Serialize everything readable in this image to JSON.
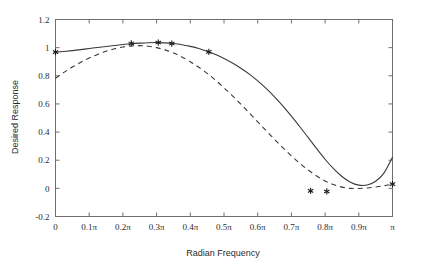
{
  "chart_data": {
    "type": "line",
    "title": "",
    "xlabel": "Radian Frequency",
    "ylabel": "Desired Response",
    "xlim": [
      0,
      1
    ],
    "ylim": [
      -0.2,
      1.2
    ],
    "grid": false,
    "legend_position": "none",
    "x_tick_labels": [
      "0",
      "0.1π",
      "0.2π",
      "0.3π",
      "0.4π",
      "0.5π",
      "0.6π",
      "0.7π",
      "0.8π",
      "0.9π",
      "π"
    ],
    "x_tick_values": [
      0,
      0.1,
      0.2,
      0.3,
      0.4,
      0.5,
      0.6,
      0.7,
      0.8,
      0.9,
      1.0
    ],
    "y_tick_labels": [
      "-0.2",
      "0",
      "0.2",
      "0.4",
      "0.6",
      "0.8",
      "1",
      "1.2"
    ],
    "y_tick_values": [
      -0.2,
      0,
      0.2,
      0.4,
      0.6,
      0.8,
      1.0,
      1.2
    ],
    "series": [
      {
        "name": "solid-response",
        "style": "solid",
        "color": "#3a3a3a",
        "x": [
          0.0,
          0.025,
          0.05,
          0.075,
          0.1,
          0.125,
          0.15,
          0.175,
          0.2,
          0.225,
          0.25,
          0.275,
          0.3,
          0.325,
          0.35,
          0.375,
          0.4,
          0.425,
          0.45,
          0.475,
          0.5,
          0.525,
          0.55,
          0.575,
          0.6,
          0.625,
          0.65,
          0.675,
          0.7,
          0.725,
          0.75,
          0.775,
          0.8,
          0.825,
          0.85,
          0.875,
          0.9,
          0.925,
          0.95,
          0.975,
          1.0
        ],
        "y": [
          0.968,
          0.973,
          0.979,
          0.986,
          0.994,
          1.001,
          1.008,
          1.015,
          1.022,
          1.028,
          1.032,
          1.035,
          1.036,
          1.034,
          1.029,
          1.021,
          1.009,
          0.994,
          0.974,
          0.951,
          0.923,
          0.891,
          0.854,
          0.812,
          0.764,
          0.71,
          0.65,
          0.584,
          0.513,
          0.438,
          0.36,
          0.282,
          0.207,
          0.14,
          0.084,
          0.044,
          0.023,
          0.024,
          0.05,
          0.11,
          0.222
        ]
      },
      {
        "name": "dashed-response",
        "style": "dashed",
        "color": "#3a3a3a",
        "x": [
          0.0,
          0.025,
          0.05,
          0.075,
          0.1,
          0.125,
          0.15,
          0.175,
          0.2,
          0.225,
          0.25,
          0.275,
          0.3,
          0.325,
          0.35,
          0.375,
          0.4,
          0.425,
          0.45,
          0.475,
          0.5,
          0.525,
          0.55,
          0.575,
          0.6,
          0.625,
          0.65,
          0.675,
          0.7,
          0.725,
          0.75,
          0.775,
          0.8,
          0.825,
          0.85,
          0.875,
          0.9,
          0.925,
          0.95,
          0.975,
          1.0
        ],
        "y": [
          0.782,
          0.824,
          0.862,
          0.896,
          0.926,
          0.952,
          0.974,
          0.992,
          1.005,
          1.012,
          1.014,
          1.01,
          1.0,
          0.984,
          0.962,
          0.934,
          0.9,
          0.861,
          0.817,
          0.768,
          0.715,
          0.658,
          0.598,
          0.536,
          0.473,
          0.41,
          0.348,
          0.288,
          0.231,
          0.178,
          0.13,
          0.088,
          0.053,
          0.027,
          0.009,
          0.0,
          -0.001,
          0.003,
          0.01,
          0.019,
          0.03
        ]
      }
    ],
    "markers": [
      {
        "x": 0.0,
        "y": 0.968,
        "symbol": "star"
      },
      {
        "x": 0.225,
        "y": 1.03,
        "symbol": "star"
      },
      {
        "x": 0.305,
        "y": 1.036,
        "symbol": "star"
      },
      {
        "x": 0.345,
        "y": 1.029,
        "symbol": "star"
      },
      {
        "x": 0.455,
        "y": 0.97,
        "symbol": "star"
      },
      {
        "x": 0.757,
        "y": -0.018,
        "symbol": "star"
      },
      {
        "x": 0.805,
        "y": -0.022,
        "symbol": "star"
      },
      {
        "x": 1.0,
        "y": 0.03,
        "symbol": "star"
      }
    ]
  }
}
